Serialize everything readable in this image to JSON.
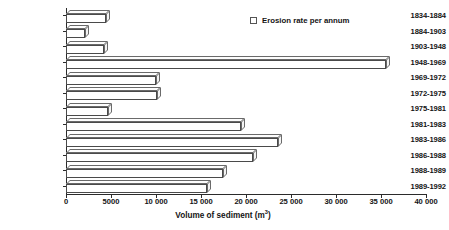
{
  "chart_data": {
    "type": "bar",
    "orientation": "horizontal",
    "title": "",
    "xlabel": "Volume of sediment (m³)",
    "ylabel": "",
    "xlim": [
      0,
      40000
    ],
    "grid": false,
    "legend": {
      "position": "top-right",
      "entries": [
        {
          "label": "Erosion rate per annum",
          "swatch": "white-square-outline"
        }
      ]
    },
    "xticks": [
      0,
      5000,
      10000,
      15000,
      20000,
      25000,
      30000,
      35000,
      40000
    ],
    "xtick_labels": [
      "0",
      "5000",
      "10 000",
      "15 000",
      "20 000",
      "25 000",
      "30 000",
      "35 000",
      "40 000"
    ],
    "categories": [
      "1834-1884",
      "1884-1903",
      "1903-1948",
      "1948-1969",
      "1969-1972",
      "1972-1975",
      "1975-1981",
      "1981-1983",
      "1983-1986",
      "1986-1988",
      "1988-1989",
      "1989-1992"
    ],
    "values": [
      4400,
      2100,
      4200,
      35500,
      10000,
      10100,
      4700,
      19400,
      23600,
      20800,
      17400,
      15700
    ],
    "series": [
      {
        "name": "Erosion rate per annum",
        "values": [
          4400,
          2100,
          4200,
          35500,
          10000,
          10100,
          4700,
          19400,
          23600,
          20800,
          17400,
          15700
        ]
      }
    ],
    "style": {
      "bar_fill": "#ffffff",
      "bar_outline": "#4a4a4a",
      "axis_color": "#2b2b2b",
      "three_d": true
    }
  }
}
